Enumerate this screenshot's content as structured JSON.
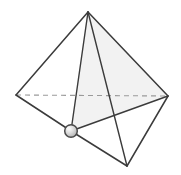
{
  "figure": {
    "type": "geometric-line-drawing",
    "canvas": {
      "width": 181,
      "height": 175,
      "background": "#ffffff"
    },
    "colors": {
      "stroke": "#3b3b3b",
      "hidden_stroke": "#9a9a9a",
      "face_fill": "#f2f2f2",
      "node_fill": "#d8d8d8",
      "node_stroke": "#4a4a4a",
      "node_highlight": "#f4f4f4",
      "background": "#ffffff"
    },
    "vertices": [
      {
        "name": "apex-top",
        "label": "A",
        "x": 88,
        "y": 12
      },
      {
        "name": "vertex-left",
        "label": "B",
        "x": 16,
        "y": 95
      },
      {
        "name": "vertex-right",
        "label": "C",
        "x": 168,
        "y": 96
      },
      {
        "name": "vertex-front",
        "label": "D",
        "x": 71,
        "y": 131
      },
      {
        "name": "vertex-bottom",
        "label": "E",
        "x": 127,
        "y": 166
      }
    ],
    "edges": [
      {
        "name": "edge-apex-left",
        "from": "apex-top",
        "to": "vertex-left",
        "style": "solid"
      },
      {
        "name": "edge-apex-right",
        "from": "apex-top",
        "to": "vertex-right",
        "style": "solid"
      },
      {
        "name": "edge-apex-front",
        "from": "apex-top",
        "to": "vertex-front",
        "style": "solid"
      },
      {
        "name": "edge-apex-bottom",
        "from": "apex-top",
        "to": "vertex-bottom",
        "style": "solid"
      },
      {
        "name": "edge-left-right",
        "from": "vertex-left",
        "to": "vertex-right",
        "style": "dashed"
      },
      {
        "name": "edge-left-front",
        "from": "vertex-left",
        "to": "vertex-front",
        "style": "solid"
      },
      {
        "name": "edge-front-right",
        "from": "vertex-front",
        "to": "vertex-right",
        "style": "solid"
      },
      {
        "name": "edge-front-bottom",
        "from": "vertex-front",
        "to": "vertex-bottom",
        "style": "solid"
      },
      {
        "name": "edge-bottom-right",
        "from": "vertex-bottom",
        "to": "vertex-right",
        "style": "solid"
      }
    ],
    "shaded_faces": [
      {
        "name": "face-apex-front-right",
        "vertices": [
          "apex-top",
          "vertex-front",
          "vertex-right"
        ],
        "fill": "#f2f2f2"
      }
    ],
    "marked_node": {
      "name": "marked-vertex-node",
      "at": "vertex-front",
      "x": 71,
      "y": 131,
      "radius": 6.5
    },
    "geometry_paths": {
      "face_shaded": "M 88 12 L 71 131 L 168 96 Z",
      "edge_apex_left": "M 88 12 L 16 95",
      "edge_apex_right": "M 88 12 L 168 96",
      "edge_apex_front": "M 88 12 L 71 131",
      "edge_apex_bottom": "M 88 12 L 127 166",
      "edge_left_right_dashed": "M 16 95 L 168 96",
      "edge_left_front": "M 16 95 L 71 131",
      "edge_front_right": "M 71 131 L 168 96",
      "edge_front_bottom": "M 71 131 L 127 166",
      "edge_bottom_right": "M 127 166 L 168 96"
    }
  }
}
